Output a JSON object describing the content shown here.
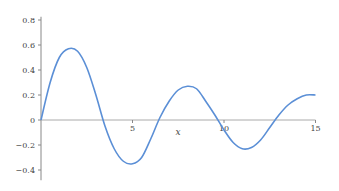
{
  "chart_data": {
    "type": "line",
    "title": "",
    "xlabel": "x",
    "ylabel": "",
    "xlim": [
      0,
      15
    ],
    "ylim": [
      -0.45,
      0.85
    ],
    "grid": false,
    "legend": null,
    "x_ticks": [
      5,
      10,
      15
    ],
    "x_tick_labels": [
      "5",
      "10",
      "15"
    ],
    "y_ticks": [
      -0.4,
      -0.2,
      0,
      0.2,
      0.4,
      0.6,
      0.8
    ],
    "y_tick_labels": [
      "−0.4",
      "−0.2",
      "0",
      "0.2",
      "0.4",
      "0.6",
      "0.8"
    ],
    "series": [
      {
        "name": "f(x)",
        "color": "#5b8fd6",
        "x": [
          0,
          0.5,
          1,
          1.5,
          2,
          2.5,
          3,
          3.5,
          4,
          4.5,
          5,
          5.5,
          6,
          6.5,
          7,
          7.5,
          8,
          8.5,
          9,
          9.5,
          10,
          10.5,
          11,
          11.5,
          12,
          12.5,
          13,
          13.5,
          14,
          14.5,
          15
        ],
        "values": [
          0,
          0.3,
          0.5,
          0.57,
          0.55,
          0.42,
          0.2,
          -0.05,
          -0.23,
          -0.33,
          -0.35,
          -0.3,
          -0.15,
          0.02,
          0.15,
          0.24,
          0.27,
          0.25,
          0.15,
          0.04,
          -0.08,
          -0.18,
          -0.23,
          -0.22,
          -0.16,
          -0.06,
          0.04,
          0.12,
          0.17,
          0.2,
          0.2
        ]
      }
    ]
  }
}
